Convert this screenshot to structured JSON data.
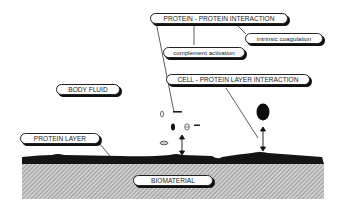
{
  "diagram": {
    "labels": {
      "protein_protein": "PROTEIN - PROTEIN INTERACTION",
      "intrinsic_coagulation": "intrinsic coagulation",
      "complement_activation": "complement activation",
      "cell_protein_layer": "CELL - PROTEIN LAYER INTERACTION",
      "body_fluid": "BODY FLUID",
      "protein_layer": "PROTEIN LAYER",
      "biomaterial": "BIOMATERIAL"
    },
    "colors": {
      "outline": "#222222",
      "protein_layer": "#1a1a1a",
      "biomaterial_hatch": "#888888",
      "background": "#ffffff"
    }
  }
}
